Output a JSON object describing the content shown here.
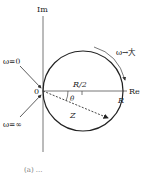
{
  "diagram": {
    "axes": {
      "imag_label": "Im",
      "real_label": "Re",
      "origin_label": "0"
    },
    "circle": {
      "half_radius_label": "R/2",
      "diameter_end_label": "R"
    },
    "vector": {
      "label": "Z",
      "angle_label": "θ"
    },
    "annotations": {
      "omega_zero": "ω=0",
      "omega_infinity": "ω=∞",
      "omega_increase": "ω→大"
    },
    "caption": "(a) ..."
  },
  "colors": {
    "line": "#222222",
    "axis": "#666666",
    "background": "#ffffff"
  }
}
